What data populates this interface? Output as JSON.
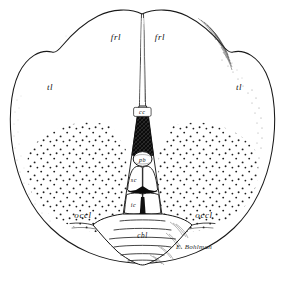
{
  "figure": {
    "signature": "E. Bohlman",
    "background_color": "#ffffff",
    "ink_color": "#1a1a1a"
  },
  "labels": {
    "frontal_left": "frl",
    "frontal_right": "frl",
    "temporal_left": "tl",
    "temporal_right": "tl",
    "occipital_left": "occl",
    "occipital_right": "occl",
    "corpus_callosum": "cc",
    "pineal_body": "pb",
    "superior_colliculus": "sc",
    "inferior_colliculus": "ic",
    "cerebellum": "cbl"
  },
  "icons": {
    "stipple": "stipple-texture-icon",
    "hatch": "cross-hatch-texture-icon",
    "shading": "edge-shading-icon"
  }
}
